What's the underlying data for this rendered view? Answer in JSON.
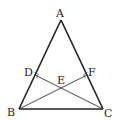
{
  "diagram": {
    "type": "geometry",
    "points": {
      "A": {
        "label": "A",
        "x": 61,
        "y": 20,
        "lx": 57,
        "ly": 16
      },
      "B": {
        "label": "B",
        "x": 19,
        "y": 109,
        "lx": 7,
        "ly": 116
      },
      "C": {
        "label": "C",
        "x": 103,
        "y": 109,
        "lx": 104,
        "ly": 117
      },
      "D": {
        "label": "D",
        "x": 35,
        "y": 75,
        "lx": 24,
        "ly": 76
      },
      "E": {
        "label": "E",
        "x": 61,
        "y": 88,
        "lx": 57,
        "ly": 84
      },
      "F": {
        "label": "F",
        "x": 87,
        "y": 75,
        "lx": 89,
        "ly": 76
      }
    },
    "segments": [
      {
        "from": "A",
        "to": "B",
        "role": "side"
      },
      {
        "from": "A",
        "to": "C",
        "role": "side"
      },
      {
        "from": "B",
        "to": "C",
        "role": "side"
      },
      {
        "from": "C",
        "to": "D",
        "role": "altitude"
      },
      {
        "from": "B",
        "to": "F",
        "role": "altitude"
      }
    ],
    "right_angles": [
      "D",
      "F"
    ],
    "colors": {
      "stroke": "#222222",
      "background": "#ffffff"
    }
  }
}
